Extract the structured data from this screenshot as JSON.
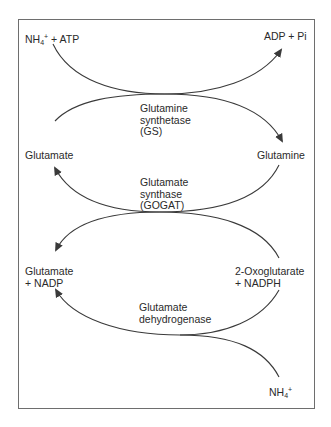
{
  "diagram": {
    "type": "metabolic-pathway",
    "title": "",
    "colors": {
      "line": "#3a3a3a",
      "frame": "#6e6e6e",
      "text": "#2a2a2a"
    },
    "nodes": {
      "nh4_atp": {
        "prefix": "NH",
        "sub": "4",
        "sup": "+",
        "suffix": " + ATP"
      },
      "adp_pi": {
        "label": "ADP + Pi"
      },
      "glutamate_top": {
        "label": "Glutamate"
      },
      "glutamine": {
        "label": "Glutamine"
      },
      "glutamate_nadp": {
        "line1": "Glutamate",
        "line2": "+ NADP"
      },
      "oxoglutarate_nadph": {
        "line1": "2-Oxoglutarate",
        "line2": "+ NADPH"
      },
      "nh4_bottom": {
        "prefix": "NH",
        "sub": "4",
        "sup": "+"
      }
    },
    "enzymes": {
      "gs": {
        "line1": "Glutamine",
        "line2": "synthetase",
        "line3": "(GS)"
      },
      "gogat": {
        "line1": "Glutamate",
        "line2": "synthase",
        "line3": "(GOGAT)"
      },
      "gdh": {
        "line1": "Glutamate",
        "line2": "dehydrogenase"
      }
    },
    "edges": [
      {
        "from": "NH4+ + ATP",
        "to": "ADP + Pi",
        "via": "GS"
      },
      {
        "from": "Glutamate",
        "to": "Glutamine",
        "via": "GS"
      },
      {
        "from": "Glutamine",
        "to": "Glutamate",
        "via": "GOGAT"
      },
      {
        "from": "2-Oxoglutarate + NADPH",
        "to": "Glutamate + NADP",
        "via": "GOGAT"
      },
      {
        "from": "2-Oxoglutarate + NADPH",
        "to": "Glutamate + NADP",
        "via": "Glutamate dehydrogenase"
      },
      {
        "from": "NH4+",
        "to": "Glutamate + NADP",
        "via": "Glutamate dehydrogenase"
      }
    ]
  }
}
